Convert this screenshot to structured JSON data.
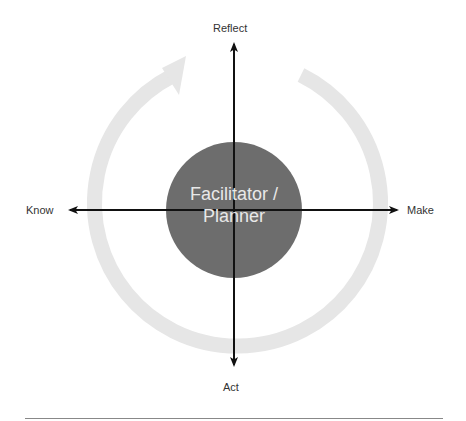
{
  "diagram": {
    "center": {
      "line1": "Facilitator /",
      "line2": "Planner",
      "fill": "#6d6d6d",
      "text_color": "#e8e8e8"
    },
    "axes": {
      "top": "Reflect",
      "bottom": "Act",
      "left": "Know",
      "right": "Make"
    },
    "cycle_arrow": {
      "color": "#e6e6e6",
      "direction": "clockwise"
    },
    "arrow_color": "#111111",
    "rule_color": "#888888"
  }
}
